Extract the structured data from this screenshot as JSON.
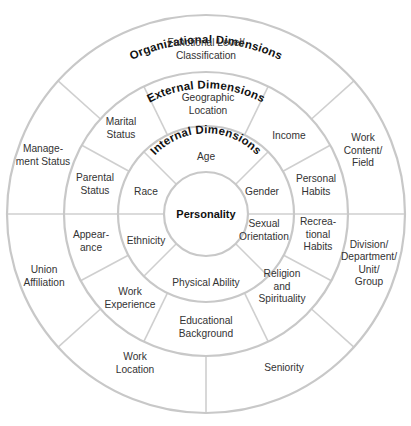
{
  "diagram": {
    "colors": {
      "ring_stroke": "#c8c8c8",
      "divider_stroke": "#cfcfcf",
      "text": "#333333",
      "title_text": "#111111",
      "background": "#ffffff"
    },
    "geometry": {
      "cx": 206,
      "cy": 214,
      "r_core": 42,
      "r_internal": 88,
      "r_external": 142,
      "r_organizational": 199
    },
    "core": {
      "label": "Personality"
    },
    "rings": {
      "internal": {
        "title": "Internal Dimensions",
        "dividers_deg": [
          0,
          45,
          135,
          180,
          225,
          315
        ],
        "segments": [
          {
            "label": [
              "Age"
            ],
            "x": 206,
            "y": 156
          },
          {
            "label": [
              "Gender"
            ],
            "x": 262,
            "y": 191
          },
          {
            "label": [
              "Sexual",
              "Orientation"
            ],
            "x": 264,
            "y": 230
          },
          {
            "label": [
              "Physical Ability"
            ],
            "x": 206,
            "y": 282
          },
          {
            "label": [
              "Ethnicity"
            ],
            "x": 146,
            "y": 240
          },
          {
            "label": [
              "Race"
            ],
            "x": 146,
            "y": 191
          }
        ]
      },
      "external": {
        "title": "External Dimensions",
        "dividers_deg": [
          0,
          29,
          64,
          116,
          151,
          180,
          208,
          244,
          296,
          332
        ],
        "segments": [
          {
            "label": [
              "Geographic",
              "Location"
            ],
            "x": 208,
            "y": 104
          },
          {
            "label": [
              "Income"
            ],
            "x": 289,
            "y": 135
          },
          {
            "label": [
              "Personal",
              "Habits"
            ],
            "x": 316,
            "y": 185
          },
          {
            "label": [
              "Recrea-",
              "tional",
              "Habits"
            ],
            "x": 318,
            "y": 234
          },
          {
            "label": [
              "Religion",
              "and",
              "Spirituality"
            ],
            "x": 282,
            "y": 286
          },
          {
            "label": [
              "Educational",
              "Background"
            ],
            "x": 206,
            "y": 327
          },
          {
            "label": [
              "Work",
              "Experience"
            ],
            "x": 130,
            "y": 298
          },
          {
            "label": [
              "Appear-",
              "ance"
            ],
            "x": 91,
            "y": 241
          },
          {
            "label": [
              "Parental",
              "Status"
            ],
            "x": 95,
            "y": 184
          },
          {
            "label": [
              "Marital",
              "Status"
            ],
            "x": 121,
            "y": 128
          }
        ]
      },
      "organizational": {
        "title": "Organizational Dimensions",
        "dividers_deg": [
          0,
          42,
          138,
          180,
          222,
          270,
          318
        ],
        "segments": [
          {
            "label": [
              "Functional Level/",
              "Classification"
            ],
            "x": 206,
            "y": 49
          },
          {
            "label": [
              "Work",
              "Content/",
              "Field"
            ],
            "x": 363,
            "y": 150
          },
          {
            "label": [
              "Division/",
              "Department/",
              "Unit/",
              "Group"
            ],
            "x": 369,
            "y": 263
          },
          {
            "label": [
              "Seniority"
            ],
            "x": 284,
            "y": 367
          },
          {
            "label": [
              "Work",
              "Location"
            ],
            "x": 135,
            "y": 363
          },
          {
            "label": [
              "Union",
              "Affiliation"
            ],
            "x": 44,
            "y": 276
          },
          {
            "label": [
              "Manage-",
              "ment Status"
            ],
            "x": 43,
            "y": 155
          }
        ]
      }
    }
  }
}
